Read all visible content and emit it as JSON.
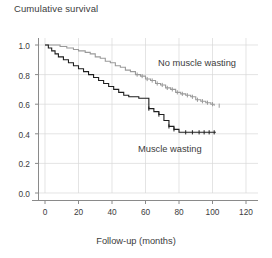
{
  "figure": {
    "axis_title": "Cumulative survival",
    "xaxis_label": "Follow-up (months)",
    "caption": "",
    "colors": {
      "group_no_wasting": "#9a9a9a",
      "group_wasting": "#1f1f1f",
      "grid": "#d5d5d5",
      "axis": "#8a8a8a",
      "text": "#3c3c3c",
      "background": "#ffffff"
    }
  },
  "labels": {
    "no_muscle_wasting": "No muscle wasting",
    "muscle_wasting": "Muscle wasting"
  },
  "yticks": [
    "0.0",
    "0.2",
    "0.4",
    "0.6",
    "0.8",
    "1.0"
  ],
  "xticks": [
    "0",
    "20",
    "40",
    "60",
    "80",
    "100",
    "120"
  ],
  "chart_data": {
    "type": "line",
    "title": "",
    "ylabel": "Cumulative survival",
    "xlabel": "Follow-up (months)",
    "xlim": [
      0,
      120
    ],
    "ylim": [
      0.0,
      1.0
    ],
    "xticks": [
      0,
      20,
      40,
      60,
      80,
      100,
      120
    ],
    "yticks": [
      0.0,
      0.2,
      0.4,
      0.6,
      0.8,
      1.0
    ],
    "grid": true,
    "legend": "in-plot annotations",
    "plot_style": "kaplan-meier step survival curves with censoring tick marks",
    "series": [
      {
        "name": "No muscle wasting",
        "color": "#9a9a9a",
        "style": "step",
        "x": [
          0,
          4,
          9,
          13,
          17,
          20,
          24,
          27,
          30,
          33,
          36,
          39,
          42,
          45,
          48,
          51,
          54,
          57,
          60,
          63,
          66,
          69,
          72,
          75,
          78,
          81,
          84,
          87,
          90,
          93,
          96,
          99,
          101
        ],
        "y": [
          1.0,
          1.0,
          0.99,
          0.98,
          0.97,
          0.96,
          0.95,
          0.94,
          0.92,
          0.91,
          0.89,
          0.88,
          0.86,
          0.85,
          0.83,
          0.82,
          0.8,
          0.79,
          0.77,
          0.76,
          0.74,
          0.73,
          0.71,
          0.7,
          0.68,
          0.67,
          0.66,
          0.65,
          0.63,
          0.62,
          0.61,
          0.6,
          0.59
        ],
        "final_value": 0.59,
        "censor_x": [
          55,
          58,
          61,
          64,
          67,
          70,
          73,
          76,
          79,
          82,
          85,
          88,
          91,
          94,
          97,
          100,
          104
        ]
      },
      {
        "name": "Muscle wasting",
        "color": "#1f1f1f",
        "style": "step",
        "x": [
          0,
          2,
          4,
          6,
          8,
          11,
          14,
          17,
          20,
          23,
          26,
          29,
          32,
          35,
          38,
          41,
          44,
          47,
          50,
          53,
          56,
          59,
          62,
          65,
          68,
          71,
          74,
          77,
          80,
          102
        ],
        "y": [
          1.0,
          0.98,
          0.96,
          0.94,
          0.92,
          0.9,
          0.88,
          0.86,
          0.84,
          0.82,
          0.8,
          0.78,
          0.76,
          0.74,
          0.72,
          0.7,
          0.68,
          0.66,
          0.65,
          0.65,
          0.64,
          0.64,
          0.57,
          0.55,
          0.53,
          0.49,
          0.45,
          0.43,
          0.41,
          0.41
        ],
        "final_value": 0.41,
        "censor_x": [
          62,
          68,
          74,
          77,
          84,
          88,
          92,
          95,
          98,
          101
        ]
      }
    ]
  }
}
